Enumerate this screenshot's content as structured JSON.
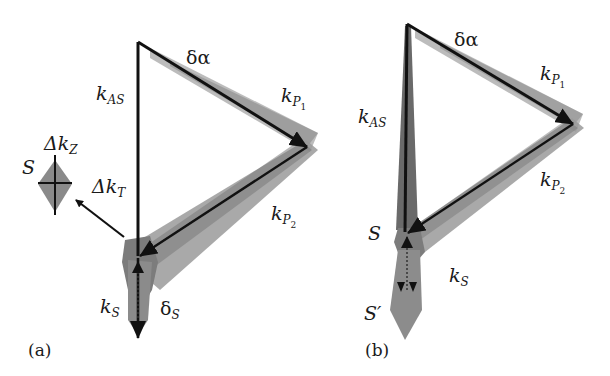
{
  "figure": {
    "panels": [
      {
        "id": "a",
        "label": "(a)",
        "labels": {
          "delta_alpha": "δα",
          "k_AS": {
            "main": "k",
            "sub": "AS"
          },
          "k_P1": {
            "main": "k",
            "sub": "P",
            "subsub": "1"
          },
          "k_P2": {
            "main": "k",
            "sub": "P",
            "subsub": "2"
          },
          "k_S": {
            "main": "k",
            "sub": "S"
          },
          "delta_S": {
            "main": "δ",
            "sub": "S"
          },
          "delta_k_T": {
            "main": "Δk",
            "sub": "T"
          },
          "delta_k_Z": {
            "main": "Δk",
            "sub": "Z"
          },
          "S": "S"
        }
      },
      {
        "id": "b",
        "label": "(b)",
        "labels": {
          "delta_alpha": "δα",
          "k_AS": {
            "main": "k",
            "sub": "AS"
          },
          "k_P1": {
            "main": "k",
            "sub": "P",
            "subsub": "1"
          },
          "k_P2": {
            "main": "k",
            "sub": "P",
            "subsub": "2"
          },
          "k_S": {
            "main": "k",
            "sub": "S"
          },
          "S": "S",
          "S_prime": "S′"
        }
      }
    ],
    "colors": {
      "vector": "#111111",
      "uncertainty_dark": "#6e6e6e",
      "uncertainty_light": "#a8a8a8",
      "background": "#ffffff"
    }
  }
}
